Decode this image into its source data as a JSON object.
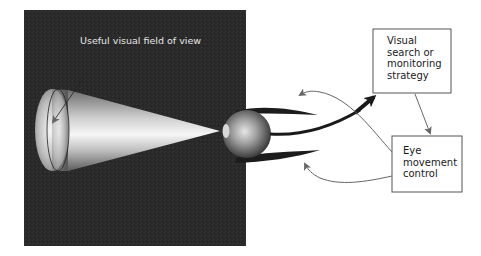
{
  "diagram": {
    "field_label": "Useful visual field of view",
    "boxes": [
      {
        "id": "strategy",
        "lines": [
          "Visual",
          "search or",
          "monitoring",
          "strategy"
        ]
      },
      {
        "id": "eye-control",
        "lines": [
          "Eye",
          "movement",
          "control"
        ]
      }
    ],
    "colors": {
      "panel": "#2a2a2a",
      "box_border": "#555555",
      "thick_arrow": "#1a1a1a",
      "thin_arrow": "#666666",
      "cone_light": "#f2f2f2",
      "cone_dark": "#6a6a6a"
    },
    "connections": [
      {
        "from": "eye",
        "to": "strategy",
        "style": "thick"
      },
      {
        "from": "strategy",
        "to": "eye-control",
        "style": "thin"
      },
      {
        "from": "eye-control",
        "to": "upper-eyelid",
        "style": "thin"
      },
      {
        "from": "eye-control",
        "to": "lower-eyelid",
        "style": "thin"
      }
    ]
  }
}
